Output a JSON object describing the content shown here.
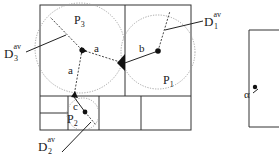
{
  "diagram": {
    "partitions": [
      {
        "id": "P3",
        "label": "P",
        "sub": "3"
      },
      {
        "id": "P1",
        "label": "P",
        "sub": "1"
      },
      {
        "id": "P2",
        "label": "P",
        "sub": "2"
      }
    ],
    "regions": [
      {
        "id": "D3av",
        "label": "D",
        "sub": "3",
        "sup": "av"
      },
      {
        "id": "D1av",
        "label": "D",
        "sub": "1",
        "sup": "av"
      },
      {
        "id": "D2av",
        "label": "D",
        "sub": "2",
        "sup": "av"
      }
    ],
    "distances": {
      "a1": "a",
      "a2": "a",
      "b": "b",
      "c": "c"
    },
    "angle_label": "α",
    "colors": {
      "line": "#333333",
      "dotted": "#999999",
      "fill": "#111111"
    }
  }
}
